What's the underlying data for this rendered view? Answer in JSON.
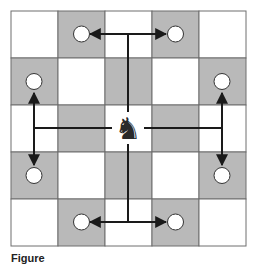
{
  "diagram": {
    "board": {
      "rows": 5,
      "cols": 5,
      "origin": [
        11,
        11
      ],
      "cell_size": 47,
      "light_color": "#ffffff",
      "dark_color": "#b9b9b9",
      "grid_color": "#6e6e6e"
    },
    "piece": {
      "name": "knight",
      "glyph": "♞",
      "row": 2,
      "col": 2
    },
    "targets": [
      {
        "row": 0,
        "col": 1
      },
      {
        "row": 0,
        "col": 3
      },
      {
        "row": 1,
        "col": 0
      },
      {
        "row": 1,
        "col": 4
      },
      {
        "row": 3,
        "col": 0
      },
      {
        "row": 3,
        "col": 4
      },
      {
        "row": 4,
        "col": 1
      },
      {
        "row": 4,
        "col": 3
      }
    ],
    "arrow_color": "#1a1a1a"
  },
  "caption": {
    "label": "Figure",
    "text": ""
  }
}
